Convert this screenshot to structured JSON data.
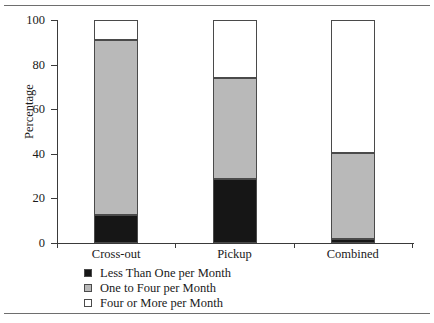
{
  "chart_data": {
    "type": "bar",
    "subtype": "stacked-bar-100",
    "title": "",
    "xlabel": "",
    "ylabel": "Percentage",
    "ylim": [
      0,
      100
    ],
    "yticks": [
      0,
      20,
      40,
      60,
      80,
      100
    ],
    "ytick_labels": [
      "0",
      "20",
      "40",
      "60",
      "80",
      "100"
    ],
    "grid": false,
    "legend_position": "bottom-left",
    "categories": [
      "Cross-out",
      "Pickup",
      "Combined"
    ],
    "series": [
      {
        "name": "Less Than One per Month",
        "color": "#161616",
        "values": [
          12.5,
          28.5,
          2.0
        ]
      },
      {
        "name": "One to Four per Month",
        "color": "#b9b9b9",
        "values": [
          78.5,
          45.5,
          38.5
        ]
      },
      {
        "name": "Four or More per Month",
        "color": "#ffffff",
        "values": [
          9.0,
          26.0,
          59.5
        ]
      }
    ],
    "cumulative_tops": {
      "Cross-out": [
        12.5,
        91.0,
        100.0
      ],
      "Pickup": [
        28.5,
        74.0,
        100.0
      ],
      "Combined": [
        2.0,
        40.5,
        100.0
      ]
    }
  },
  "axis": {
    "y_title": "Percentage",
    "ticks": [
      {
        "value": 100,
        "label": "100"
      },
      {
        "value": 80,
        "label": "80"
      },
      {
        "value": 60,
        "label": "60"
      },
      {
        "value": 40,
        "label": "40"
      },
      {
        "value": 20,
        "label": "20"
      },
      {
        "value": 0,
        "label": "0"
      }
    ]
  },
  "categories": [
    {
      "label": "Cross-out"
    },
    {
      "label": "Pickup"
    },
    {
      "label": "Combined"
    }
  ],
  "legend": {
    "items": [
      {
        "label": "Less Than One per Month",
        "swatch": "black"
      },
      {
        "label": "One to Four per Month",
        "swatch": "gray"
      },
      {
        "label": "Four or More per Month",
        "swatch": "white"
      }
    ]
  },
  "colors": {
    "black_segment": "#161616",
    "gray_segment": "#b9b9b9",
    "white_segment": "#ffffff",
    "outline": "#4a4a4a",
    "axis": "#3a3a3a",
    "rule": "#6e6e6e"
  }
}
